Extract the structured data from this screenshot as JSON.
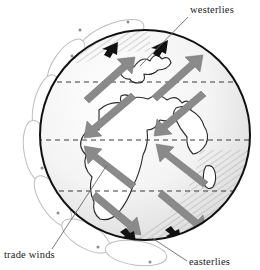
{
  "labels": [
    {
      "id": "westerlies",
      "text": "westerlies",
      "position": "top-right",
      "text_x": 190,
      "text_y": 13,
      "leader": {
        "x1": 188,
        "y1": 17,
        "x2": 140,
        "y2": 66
      }
    },
    {
      "id": "trade-winds",
      "text": "trade winds",
      "position": "bottom-left",
      "text_x": 4,
      "text_y": 258,
      "leader": {
        "x1": 52,
        "y1": 249,
        "x2": 107,
        "y2": 165
      }
    },
    {
      "id": "easterlies",
      "text": "easterlies",
      "position": "bottom-right",
      "text_x": 189,
      "text_y": 265,
      "leader": {
        "x1": 187,
        "y1": 261,
        "x2": 152,
        "y2": 238
      }
    }
  ],
  "globe": {
    "center_x": 145,
    "center_y": 135,
    "radius": 105,
    "outline_color": "#111111",
    "hatch_color": "#9a9a9a",
    "shade_color": "#e9e9e9",
    "land_outline_color": "#2a2a2a"
  },
  "latitude_lines": [
    {
      "name": "30-north",
      "y": 82,
      "style": "dashed"
    },
    {
      "name": "equator",
      "y": 140,
      "style": "dashed"
    },
    {
      "name": "30-south",
      "y": 191,
      "style": "dashed"
    }
  ],
  "wind_arrows": {
    "polar_easterlies_north": {
      "color": "#111111",
      "direction": "left",
      "count": 2,
      "band": "north-polar"
    },
    "westerlies_north": {
      "color": "#8a8a8a",
      "direction": "up-right",
      "count": 2,
      "band": "north-mid-latitude"
    },
    "trade_winds_north": {
      "color": "#8a8a8a",
      "direction": "down-left",
      "count": 2,
      "band": "north-tropics"
    },
    "trade_winds_south": {
      "color": "#8a8a8a",
      "direction": "up-left",
      "count": 2,
      "band": "south-tropics"
    },
    "westerlies_south": {
      "color": "#8a8a8a",
      "direction": "down-right",
      "count": 2,
      "band": "south-mid-latitude"
    },
    "polar_easterlies_south": {
      "color": "#111111",
      "direction": "up-left",
      "count": 2,
      "band": "south-polar"
    }
  },
  "circulation_cells": {
    "description": "convection cell loops drawn around the globe rim",
    "outline_color": "#b5b5b5",
    "count": 7
  }
}
